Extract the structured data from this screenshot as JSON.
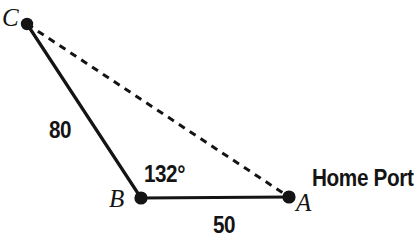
{
  "diagram": {
    "kind": "triangle-geometry-figure",
    "width": 418,
    "height": 250,
    "background_color": "#ffffff",
    "stroke_color": "#141414",
    "vertices": [
      {
        "id": "C",
        "label": "C",
        "x": 27,
        "y": 24,
        "dot_radius": 6.2
      },
      {
        "id": "B",
        "label": "B",
        "x": 141,
        "y": 198,
        "dot_radius": 6.6
      },
      {
        "id": "A",
        "label": "A",
        "x": 289,
        "y": 197,
        "dot_radius": 6.6
      }
    ],
    "edges": [
      {
        "id": "CB",
        "from": "C",
        "to": "B",
        "style": "solid",
        "stroke_width": 3.2,
        "measure": "80"
      },
      {
        "id": "BA",
        "from": "B",
        "to": "A",
        "style": "solid",
        "stroke_width": 3.2,
        "measure": "50"
      },
      {
        "id": "CA",
        "from": "C",
        "to": "A",
        "style": "dashed",
        "stroke_width": 3.0,
        "dash_pattern": "7 6",
        "measure": ""
      }
    ],
    "angles": [
      {
        "at": "B",
        "label": "132°",
        "value": 132,
        "unit": "degrees"
      }
    ],
    "annotations": [
      {
        "id": "home-port",
        "text": "Home Port",
        "anchor_vertex": "A"
      }
    ],
    "labels": {
      "vertex_c": "C",
      "vertex_b": "B",
      "vertex_a": "A",
      "side_cb": "80",
      "side_ba": "50",
      "angle_b": "132°",
      "home_port": "Home Port"
    }
  }
}
